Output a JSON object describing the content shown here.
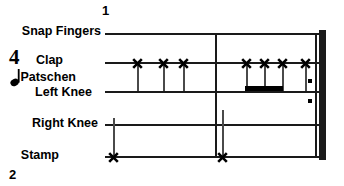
{
  "score": {
    "measure_numbers": [
      {
        "label": "1",
        "position": "above-staff-start"
      },
      {
        "label": "2",
        "position": "below-staff-left"
      }
    ],
    "time_signature": {
      "number": "4",
      "beat_unit_icon": "quarter-note-icon"
    },
    "staff_lines": [
      {
        "id": "snap-fingers",
        "label": "Snap Fingers",
        "y": 33
      },
      {
        "id": "clap",
        "label": "Clap",
        "y": 62
      },
      {
        "id": "left-knee",
        "label": "Left Knee",
        "y": 91
      },
      {
        "id": "right-knee",
        "label": "Right Knee",
        "y": 124
      },
      {
        "id": "stamp",
        "label": "Stamp",
        "y": 156
      }
    ],
    "extra_labels": [
      {
        "id": "patschen",
        "label": "Patschen"
      }
    ],
    "barlines": [
      {
        "id": "barline-middle",
        "type": "single",
        "x": 215
      },
      {
        "id": "final-barline",
        "type": "thick-double-with-repeat-dots",
        "x": 315
      }
    ],
    "repeat_dots": [
      {
        "id": "repeat-dot-upper",
        "x": 308,
        "y": 79
      },
      {
        "id": "repeat-dot-lower",
        "x": 308,
        "y": 99
      }
    ],
    "notes": [
      {
        "id": "clap-note-1",
        "staff": "clap",
        "x": 137,
        "notehead": "x",
        "stem": "down",
        "stem_to_y": 91
      },
      {
        "id": "clap-note-2",
        "staff": "clap",
        "x": 163,
        "notehead": "x",
        "stem": "down",
        "stem_to_y": 91
      },
      {
        "id": "clap-note-3",
        "staff": "clap",
        "x": 183,
        "notehead": "x",
        "stem": "down",
        "stem_to_y": 91
      },
      {
        "id": "clap-note-4",
        "staff": "clap",
        "x": 246,
        "notehead": "x",
        "stem": "down",
        "stem_to_y": 91
      },
      {
        "id": "clap-note-5",
        "staff": "clap",
        "x": 264,
        "notehead": "x",
        "stem": "down",
        "stem_to_y": 91
      },
      {
        "id": "clap-note-6",
        "staff": "clap",
        "x": 282,
        "notehead": "x",
        "stem": "down",
        "stem_to_y": 91
      },
      {
        "id": "clap-note-7",
        "staff": "clap",
        "x": 305,
        "notehead": "x",
        "stem": "down",
        "stem_to_y": 91
      },
      {
        "id": "stamp-note-1",
        "staff": "stamp",
        "x": 113,
        "notehead": "x",
        "stem": "up",
        "stem_to_y": 118
      },
      {
        "id": "stamp-note-2",
        "staff": "stamp",
        "x": 222,
        "notehead": "x",
        "stem": "up",
        "stem_to_y": 110
      }
    ],
    "beams": [
      {
        "id": "beam-right-group",
        "from_x": 245,
        "to_x": 283,
        "y": 86
      }
    ],
    "geometry": {
      "staff_left_x": 105,
      "staff_right_x": 322,
      "right_knee_left_x": 105,
      "right_knee_right_x": 322
    },
    "colors": {
      "ink": "#000000",
      "staff": "#1a1a1a",
      "stem": "#4a4a4a",
      "background": "#ffffff"
    }
  }
}
